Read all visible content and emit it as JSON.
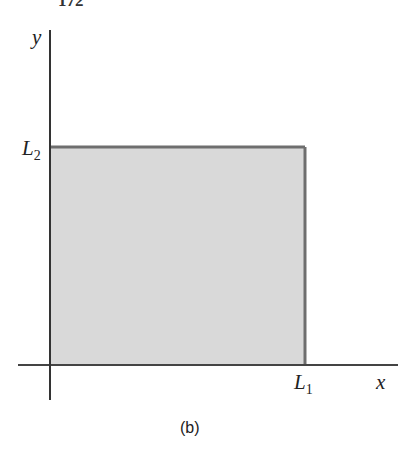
{
  "page_number": "172",
  "diagram": {
    "axes": {
      "x_label": "x",
      "y_label": "y"
    },
    "region": {
      "x_extent_label": "L",
      "x_extent_sub": "1",
      "y_extent_label": "L",
      "y_extent_sub": "2",
      "fill": "#d9d9d9",
      "stroke": "#6e6e6e"
    },
    "caption": "(b)"
  }
}
